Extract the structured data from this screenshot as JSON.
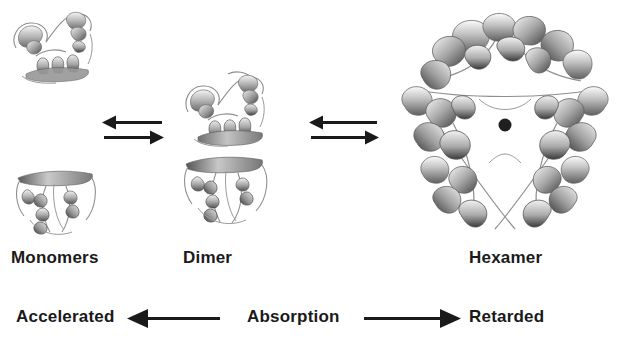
{
  "figure": {
    "background_color": "#ffffff",
    "ink_color": "#1a1a1a"
  },
  "states": [
    {
      "key": "monomers",
      "label": "Monomers",
      "structure_name": "protein-monomer-ribbon",
      "subunit_count": 2
    },
    {
      "key": "dimer",
      "label": "Dimer",
      "structure_name": "protein-dimer-ribbon",
      "subunit_count": 2
    },
    {
      "key": "hexamer",
      "label": "Hexamer",
      "structure_name": "protein-hexamer-ribbon",
      "subunit_count": 6,
      "center_ion": "zinc-ion"
    }
  ],
  "equilibria": [
    {
      "key": "monomer-dimer",
      "forward_direction": "right",
      "reverse_direction": "left",
      "glyph": "reversible-reaction-arrows"
    },
    {
      "key": "dimer-hexamer",
      "forward_direction": "right",
      "reverse_direction": "left",
      "glyph": "reversible-reaction-arrows"
    }
  ],
  "absorption_axis": {
    "center_label": "Absorption",
    "left_label": "Accelerated",
    "right_label": "Retarded",
    "left_arrow_direction": "left",
    "right_arrow_direction": "right"
  }
}
